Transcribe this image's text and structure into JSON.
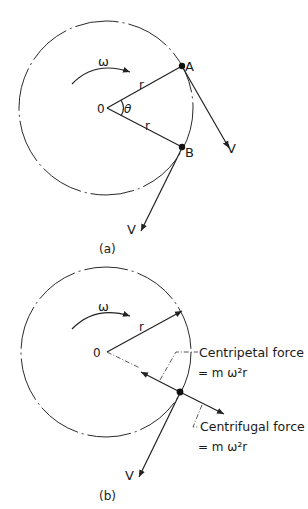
{
  "diagram_a": {
    "caption": "(a)",
    "omega_label": "ω",
    "center_label": "0",
    "angle_label": "θ",
    "radius_label_1": "r",
    "radius_label_2": "r",
    "point_a_label": "A",
    "point_b_label": "B",
    "velocity_a_label": "V",
    "velocity_b_label": "V"
  },
  "diagram_b": {
    "caption": "(b)",
    "omega_label": "ω",
    "center_label": "0",
    "radius_label": "r",
    "velocity_label": "V",
    "centripetal": {
      "label": "Centripetal force",
      "formula": "= m ω²r"
    },
    "centrifugal": {
      "label": "Centrifugal force",
      "formula": "= m ω²r"
    }
  },
  "colors": {
    "ink": "#222222",
    "background": "#ffffff"
  }
}
